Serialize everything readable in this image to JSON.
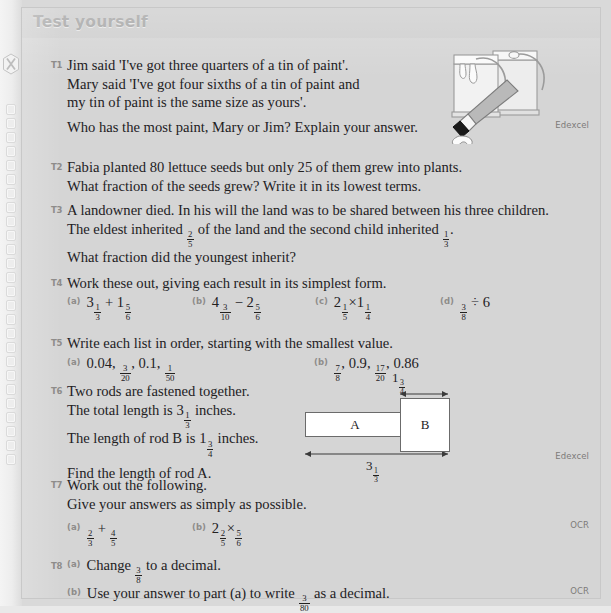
{
  "page": {
    "background_color": "#d9d9d9",
    "panel_color": "#d5d5d5",
    "header_bar_color": "#cfcfcf",
    "header_text_color": "#a8a8a8",
    "body_text_color": "#23211f",
    "label_color": "#8e8c8a"
  },
  "margin": {
    "icon_name": "x-in-hexagon-icon",
    "binding_hole_count": 26
  },
  "header": {
    "title": "Test yourself"
  },
  "questions": [
    {
      "number": "T1",
      "lines": [
        "Jim said 'I've got three quarters of a tin of paint'.",
        "Mary said 'I've got four sixths of a tin of paint and",
        "my tin of paint is the same size as yours'.",
        "Who has the most paint, Mary or Jim? Explain your answer."
      ],
      "board": "Edexcel"
    },
    {
      "number": "T2",
      "lines": [
        "Fabia planted 80 lettuce seeds but only 25 of them grew into plants.",
        "What fraction of the seeds grew? Write it in its lowest terms."
      ]
    },
    {
      "number": "T3",
      "lines": [
        "A landowner died. In his will the land was to be shared between his three children.",
        "The eldest inherited @f{2/5} of the land and the second child inherited @f{1/3}.",
        "What fraction did the youngest inherit?"
      ]
    },
    {
      "number": "T4",
      "lines": [
        "Work these out, giving each result in its simplest form."
      ],
      "parts": [
        {
          "label": "(a)",
          "expr": "3@f{1/3} + 1@f{5/6}"
        },
        {
          "label": "(b)",
          "expr": "4@f{3/10} − 2@f{5/6}"
        },
        {
          "label": "(c)",
          "expr": "2@f{1/5}×1@f{1/4}"
        },
        {
          "label": "(d)",
          "expr": "@f{3/8} ÷ 6"
        }
      ]
    },
    {
      "number": "T5",
      "lines": [
        "Write each list in order, starting with the smallest value."
      ],
      "parts": [
        {
          "label": "(a)",
          "expr": "0.04, @f{3/20}, 0.1, @f{1/50}"
        },
        {
          "label": "(b)",
          "expr": "@f{7/8}, 0.9, @f{17/20}, 0.86"
        }
      ]
    },
    {
      "number": "T6",
      "lines": [
        "Two rods are fastened together.",
        "The total length is 3@f{1/3} inches.",
        "The length of rod B is 1@f{3/4} inches.",
        "Find the length of rod A."
      ],
      "board": "Edexcel"
    },
    {
      "number": "T7",
      "lines": [
        "Work out the following.",
        "Give your answers as simply as possible."
      ],
      "parts": [
        {
          "label": "(a)",
          "expr": "@f{2/3} + @f{4/5}"
        },
        {
          "label": "(b)",
          "expr": "2@f{2/5}×@f{5/6}"
        }
      ],
      "board": "OCR"
    },
    {
      "number": "T8",
      "parts": [
        {
          "label": "(a)",
          "expr": "Change @f{3/8} to a decimal."
        },
        {
          "label": "(b)",
          "expr": "Use your answer to part (a) to write @f{3/80} as a decimal."
        }
      ],
      "board": "OCR"
    }
  ],
  "rod_diagram": {
    "rod_a_label": "A",
    "rod_b_label": "B",
    "top_dimension": "1@f{3/4}",
    "bottom_dimension": "3@f{1/3}"
  },
  "illustration": {
    "name": "paint-tins-and-brush-illustration",
    "elements": [
      "paint-tin-left",
      "paint-tin-right",
      "paint-brush",
      "paint-drip"
    ]
  }
}
